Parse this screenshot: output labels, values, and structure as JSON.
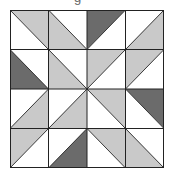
{
  "title_fragment": "g",
  "colors": {
    "white": "#ffffff",
    "light": "#c9c9c9",
    "dark": "#6b6b6b",
    "line": "#222222"
  },
  "grid": {
    "rows": 4,
    "cols": 4,
    "cells": [
      [
        {
          "diag": "TL-BR",
          "upper": "light",
          "lower": "white"
        },
        {
          "diag": "TL-BR",
          "upper": "white",
          "lower": "light"
        },
        {
          "diag": "TR-BL",
          "upper": "dark",
          "lower": "white"
        },
        {
          "diag": "TR-BL",
          "upper": "white",
          "lower": "light"
        }
      ],
      [
        {
          "diag": "TL-BR",
          "upper": "white",
          "lower": "dark"
        },
        {
          "diag": "TL-BR",
          "upper": "white",
          "lower": "light"
        },
        {
          "diag": "TR-BL",
          "upper": "light",
          "lower": "white"
        },
        {
          "diag": "TR-BL",
          "upper": "light",
          "lower": "white"
        }
      ],
      [
        {
          "diag": "TR-BL",
          "upper": "white",
          "lower": "light"
        },
        {
          "diag": "TR-BL",
          "upper": "white",
          "lower": "light"
        },
        {
          "diag": "TL-BR",
          "upper": "light",
          "lower": "white"
        },
        {
          "diag": "TL-BR",
          "upper": "dark",
          "lower": "white"
        }
      ],
      [
        {
          "diag": "TR-BL",
          "upper": "light",
          "lower": "white"
        },
        {
          "diag": "TR-BL",
          "upper": "white",
          "lower": "dark"
        },
        {
          "diag": "TL-BR",
          "upper": "light",
          "lower": "white"
        },
        {
          "diag": "TL-BR",
          "upper": "white",
          "lower": "light"
        }
      ]
    ]
  }
}
